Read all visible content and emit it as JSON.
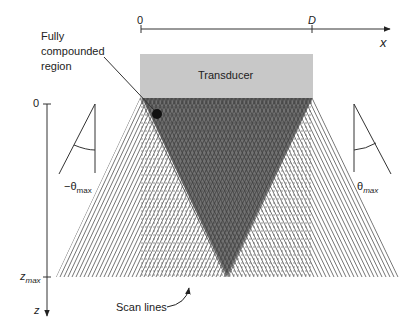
{
  "x_axis": {
    "origin_label": "0",
    "end_tick_label": "D",
    "axis_label": "x"
  },
  "z_axis": {
    "origin_label": "0",
    "max_label_main": "z",
    "max_label_sub": "max",
    "axis_label": "z"
  },
  "transducer": {
    "label": "Transducer",
    "fill": "#c8c8c8"
  },
  "annotations": {
    "region_line1": "Fully",
    "region_line2": "compounded",
    "region_line3": "region",
    "scan_lines": "Scan lines"
  },
  "angles": {
    "left_prefix": "−θ",
    "left_sub": "max",
    "right_prefix": "θ",
    "right_sub": "max"
  },
  "colors": {
    "line": "#333333",
    "compound_region": "#555555",
    "scanline": "#444444"
  }
}
